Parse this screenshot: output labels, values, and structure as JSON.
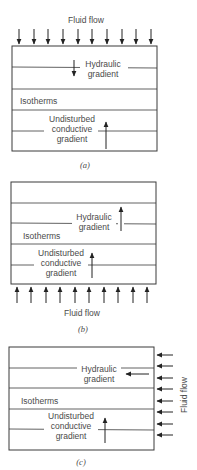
{
  "panels": [
    {
      "id": "a",
      "caption": "(a)",
      "flow_label": "Fluid flow",
      "flow_direction": "downward",
      "hydraulic_label_line1": "Hydraulic",
      "hydraulic_label_line2": "gradient",
      "hydraulic_direction": "down",
      "isotherms_label": "Isotherms",
      "conductive_label_line1": "Undisturbed",
      "conductive_label_line2": "conductive",
      "conductive_label_line3": "gradient",
      "conductive_direction": "up"
    },
    {
      "id": "b",
      "caption": "(b)",
      "flow_label": "Fluid flow",
      "flow_direction": "upward",
      "hydraulic_label_line1": "Hydraulic",
      "hydraulic_label_line2": "gradient",
      "hydraulic_direction": "up",
      "isotherms_label": "Isotherms",
      "conductive_label_line1": "Undisturbed",
      "conductive_label_line2": "conductive",
      "conductive_label_line3": "gradient",
      "conductive_direction": "up"
    },
    {
      "id": "c",
      "caption": "(c)",
      "flow_label": "Fluid flow",
      "flow_direction": "leftward",
      "hydraulic_label_line1": "Hydraulic",
      "hydraulic_label_line2": "gradient",
      "hydraulic_direction": "left",
      "isotherms_label": "Isotherms",
      "conductive_label_line1": "Undisturbed",
      "conductive_label_line2": "conductive",
      "conductive_label_line3": "gradient",
      "conductive_direction": "up"
    }
  ],
  "colors": {
    "line": "#3a3a3a",
    "text": "#4a4a4a",
    "arrow": "#222222",
    "background": "#ffffff"
  }
}
